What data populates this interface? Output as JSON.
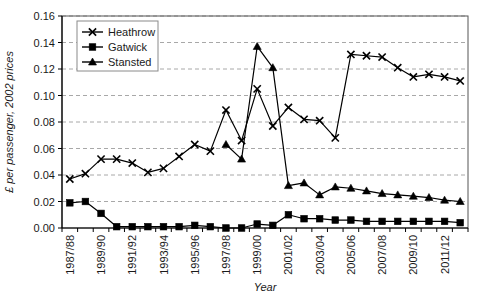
{
  "chart_data": {
    "type": "line",
    "title": "",
    "xlabel": "Year",
    "ylabel": "£ per passenger, 2002 prices",
    "ylim": [
      0.0,
      0.16
    ],
    "yticks": [
      "0.00",
      "0.02",
      "0.04",
      "0.06",
      "0.08",
      "0.10",
      "0.12",
      "0.14",
      "0.16"
    ],
    "ytick_values": [
      0.0,
      0.02,
      0.04,
      0.06,
      0.08,
      0.1,
      0.12,
      0.14,
      0.16
    ],
    "grid": "horizontal-dashed",
    "legend_position": "top-left",
    "x": [
      "1987/88",
      "1988/89",
      "1989/90",
      "1990/91",
      "1991/92",
      "1992/93",
      "1993/94",
      "1994/95",
      "1995/96",
      "1996/97",
      "1997/98",
      "1998/99",
      "1999/00",
      "2000/01",
      "2001/02",
      "2002/03",
      "2003/04",
      "2004/05",
      "2005/06",
      "2006/07",
      "2007/08",
      "2008/09",
      "2009/10",
      "2010/11",
      "2011/12",
      "2012/13"
    ],
    "xtick_labels": [
      "1987/88",
      "",
      "1989/90",
      "",
      "1991/92",
      "",
      "1993/94",
      "",
      "1995/96",
      "",
      "1997/98",
      "",
      "1999/00",
      "",
      "2001/02",
      "",
      "2003/04",
      "",
      "2005/06",
      "",
      "2007/08",
      "",
      "2009/10",
      "",
      "2011/12",
      ""
    ],
    "series": [
      {
        "name": "Heathrow",
        "marker": "cross",
        "color": "#000000",
        "values": [
          0.037,
          0.041,
          0.052,
          0.052,
          0.049,
          0.042,
          0.045,
          0.054,
          0.063,
          0.058,
          0.089,
          0.066,
          0.105,
          0.077,
          0.091,
          0.082,
          0.081,
          0.068,
          0.131,
          0.13,
          0.129,
          0.121,
          0.114,
          0.116,
          0.114,
          0.111
        ]
      },
      {
        "name": "Gatwick",
        "marker": "square",
        "color": "#000000",
        "values": [
          0.019,
          0.02,
          0.011,
          0.001,
          0.001,
          0.001,
          0.001,
          0.001,
          0.002,
          0.001,
          0.0,
          0.0,
          0.003,
          0.002,
          0.01,
          0.007,
          0.007,
          0.006,
          0.006,
          0.005,
          0.005,
          0.005,
          0.005,
          0.005,
          0.005,
          0.004
        ]
      },
      {
        "name": "Stansted",
        "marker": "triangle",
        "color": "#000000",
        "values": [
          null,
          null,
          null,
          null,
          null,
          null,
          null,
          null,
          null,
          null,
          0.063,
          0.052,
          0.137,
          0.121,
          0.032,
          0.034,
          0.025,
          0.031,
          0.03,
          0.028,
          0.026,
          0.025,
          0.024,
          0.023,
          0.021,
          0.02
        ]
      }
    ]
  },
  "legend": {
    "items": [
      {
        "label": "Heathrow"
      },
      {
        "label": "Gatwick"
      },
      {
        "label": "Stansted"
      }
    ]
  }
}
